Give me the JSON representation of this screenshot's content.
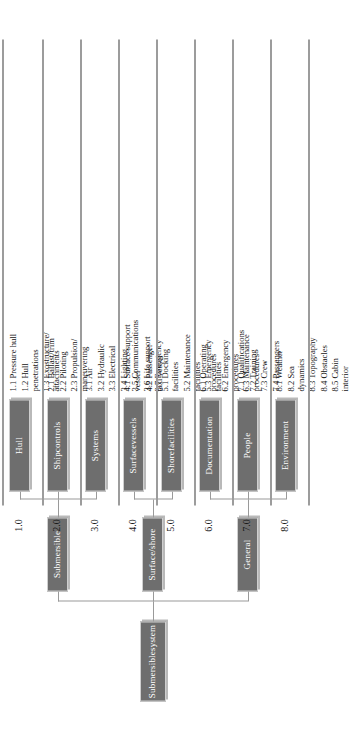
{
  "diagram": {
    "type": "hierarchical-breakdown",
    "orientation": "rotated-90-ccw",
    "box_fill": "#6e6e6e",
    "box_text": "#ffffff",
    "line_color": "#9a9a9a"
  },
  "root": {
    "label": "Submersible\nsystem"
  },
  "level1": [
    {
      "id": "submersible",
      "label": "Submersible"
    },
    {
      "id": "surface-shore",
      "label": "Surface/\nshore"
    },
    {
      "id": "general",
      "label": "General"
    }
  ],
  "columns": [
    {
      "number": "1.0",
      "title": "Hull",
      "parent": "submersible",
      "items": [
        "1.1 Pressure hull",
        "1.2 Hull\n      penetrations",
        "1.3 Exostructure/\n      attachments"
      ]
    },
    {
      "number": "2.0",
      "title": "Ship\ncontrols",
      "parent": "submersible",
      "items": [
        "2.1 Ballast/trim",
        "2.2 Piloting",
        "2.3 Propulsion/\n      maneuvering"
      ]
    },
    {
      "number": "3.0",
      "title": "Systems",
      "parent": "submersible",
      "items": [
        "3.1 Air",
        "3.2 Hydraulic",
        "3.3 Electrical",
        "3.4 Lighting",
        "3.5 Communications",
        "3.6 Life support",
        "3.7 Emergency"
      ]
    },
    {
      "number": "4.0",
      "title": "Surface\nvessels",
      "parent": "surface-shore",
      "items": [
        "4.1 Surface support\n      vessel",
        "4.2 Passenger\n      taxi vessel"
      ]
    },
    {
      "number": "5.0",
      "title": "Shore\nfacilities",
      "parent": "surface-shore",
      "items": [
        "5.1 Docking\n      facilities",
        "5.2 Maintenance\n      facilities",
        "5.3 Emergency\n      facilities"
      ]
    },
    {
      "number": "6.0",
      "title": "Documentation",
      "parent": "general",
      "items": [
        "6.1 Operating\n      procedures",
        "6.2 Emergency\n      procedures",
        "6.3 Maintenance\n      procedures"
      ]
    },
    {
      "number": "7.0",
      "title": "People",
      "parent": "general",
      "items": [
        "7.1 Qualifications",
        "7.2 Training",
        "7.3 Crew",
        "7.4 Passengers"
      ]
    },
    {
      "number": "8.0",
      "title": "Environment",
      "parent": "general",
      "items": [
        "8.1 Weather",
        "8.2 Sea\n      dynamics",
        "8.3 Topography",
        "8.4 Obstacles",
        "8.5 Cabin\n      interior"
      ]
    }
  ]
}
